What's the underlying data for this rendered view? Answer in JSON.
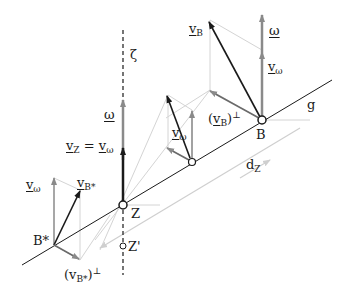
{
  "diagram": {
    "type": "kinematics-screw-axis",
    "colors": {
      "black": "#1a1a1a",
      "gray_vector": "#8a8a8a",
      "light_construction": "#cfcfcf",
      "background": "#ffffff"
    },
    "labels": {
      "zeta": "ζ",
      "omega_Z": "ω",
      "vZ_eq": "v",
      "vZ_sub": "Z",
      "eq_sign": " = ",
      "vomega_Z": "v",
      "omega_sub": "ω",
      "vB": "v",
      "vB_sub": "B",
      "omega_B": "ω",
      "vomega_B": "v",
      "vB_perp_open": "(",
      "vB_perp_v": "v",
      "vB_perp_sub": "B",
      "vB_perp_close": ")",
      "perp": "⊥",
      "point_B": "B",
      "line_g": "g",
      "vomega_mid": "v",
      "dZ": "d",
      "dZ_sub": "Z",
      "point_Z": "Z",
      "point_Zprime": "Z'",
      "vomega_Bstar": "v",
      "vBstar": "v",
      "vBstar_sub": "B*",
      "point_Bstar": "B*",
      "vBstar_perp_v": "v",
      "vBstar_perp_sub": "B*"
    },
    "points": {
      "Z": [
        123,
        205
      ],
      "B": [
        262,
        120
      ],
      "M": [
        192,
        162
      ],
      "B_star": [
        54,
        245
      ],
      "Z_prime": [
        123,
        246
      ]
    }
  }
}
